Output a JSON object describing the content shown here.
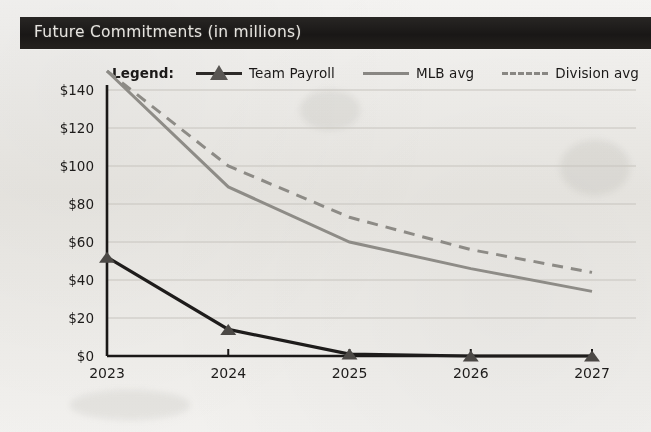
{
  "header": {
    "title": "Future Commitments (in millions)"
  },
  "legend": {
    "label": "Legend:",
    "entries": [
      {
        "name": "Team Payroll",
        "style": "solid-marker",
        "color": "#201e1d"
      },
      {
        "name": "MLB avg",
        "style": "solid",
        "color": "#908e89"
      },
      {
        "name": "Division avg",
        "style": "dashed",
        "color": "#8f8d88"
      }
    ]
  },
  "chart_data": {
    "type": "line",
    "title": "Future Commitments (in millions)",
    "xlabel": "",
    "ylabel": "",
    "categories": [
      "2023",
      "2024",
      "2025",
      "2026",
      "2027"
    ],
    "x_tick_labels": [
      "2023",
      "2024",
      "2025",
      "2026",
      "2027"
    ],
    "y_tick_labels": [
      "$0",
      "$20",
      "$40",
      "$60",
      "$80",
      "$100",
      "$120",
      "$140"
    ],
    "y_tick_values": [
      0,
      20,
      40,
      60,
      80,
      100,
      120,
      140
    ],
    "ylim": [
      0,
      152
    ],
    "grid": true,
    "legend_position": "top",
    "value_prefix": "$",
    "value_unit": "millions",
    "series": [
      {
        "name": "Team Payroll",
        "values": [
          52,
          14,
          1,
          0,
          0
        ],
        "color": "#201e1d",
        "dash": false,
        "marker": "triangle"
      },
      {
        "name": "MLB avg",
        "values": [
          150,
          89,
          60,
          46,
          34
        ],
        "color": "#908e89",
        "dash": false,
        "marker": "none"
      },
      {
        "name": "Division avg",
        "values": [
          150,
          100,
          73,
          56,
          44
        ],
        "color": "#8f8d88",
        "dash": true,
        "marker": "none"
      }
    ]
  }
}
